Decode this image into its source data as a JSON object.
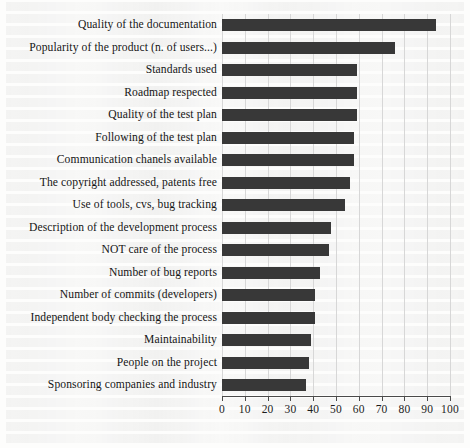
{
  "chart_data": {
    "type": "bar",
    "orientation": "horizontal",
    "title": "",
    "subtitle": "",
    "xlabel": "",
    "ylabel": "",
    "xlim": [
      0,
      100
    ],
    "grid": true,
    "legend": null,
    "bar_color": "#383838",
    "gridline_color": "#d7d7d7",
    "axis_color": "#4a4a4a",
    "xticks": [
      0,
      10,
      20,
      30,
      40,
      50,
      60,
      70,
      80,
      90,
      100
    ],
    "xtick_labels": [
      "0",
      "10",
      "20",
      "30",
      "40",
      "50",
      "60",
      "70",
      "80",
      "90",
      "100"
    ],
    "categories": [
      "Quality of the documentation",
      "Popularity of the product (n. of users...)",
      "Standards used",
      "Roadmap respected",
      "Quality of the test plan",
      "Following of the test plan",
      "Communication chanels available",
      "The copyright addressed, patents free",
      "Use of tools, cvs, bug tracking",
      "Description of the development process",
      "NOT care of the process",
      "Number of bug reports",
      "Number of commits (developers)",
      "Independent body checking the process",
      "Maintainability",
      "People on the project",
      "Sponsoring companies and industry"
    ],
    "values": [
      94,
      76,
      59,
      59,
      59,
      58,
      58,
      56,
      54,
      48,
      47,
      43,
      41,
      41,
      39,
      38,
      37
    ]
  }
}
